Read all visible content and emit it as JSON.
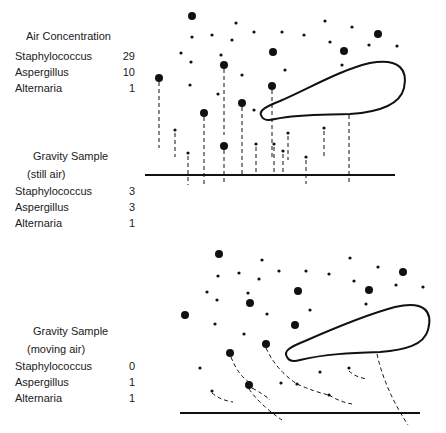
{
  "panels": {
    "air": {
      "title": "Air Concentration",
      "rows": [
        {
          "name": "Staphylococcus",
          "value": "29"
        },
        {
          "name": "Aspergillus",
          "value": "10"
        },
        {
          "name": "Alternaria",
          "value": "1"
        }
      ]
    },
    "still": {
      "title": "Gravity Sample",
      "subtitle": "(still air)",
      "rows": [
        {
          "name": "Staphylococcus",
          "value": "3"
        },
        {
          "name": "Aspergillus",
          "value": "3"
        },
        {
          "name": "Alternaria",
          "value": "1"
        }
      ]
    },
    "moving": {
      "title": "Gravity Sample",
      "subtitle": "(moving air)",
      "rows": [
        {
          "name": "Staphylococcus",
          "value": "0"
        },
        {
          "name": "Aspergillus",
          "value": "1"
        },
        {
          "name": "Alternaria",
          "value": "1"
        }
      ]
    }
  },
  "colors": {
    "ink": "#111111",
    "background": "#ffffff"
  }
}
